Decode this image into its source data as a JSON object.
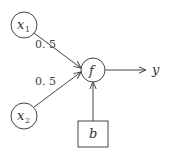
{
  "diagram": {
    "type": "perceptron",
    "colors": {
      "stroke": "#444444",
      "text": "#333333",
      "background": "#ffffff"
    },
    "nodes": [
      {
        "id": "x1",
        "label": "x",
        "subscript": "1",
        "shape": "circle"
      },
      {
        "id": "x2",
        "label": "x",
        "subscript": "2",
        "shape": "circle"
      },
      {
        "id": "f",
        "label": "f",
        "shape": "circle"
      },
      {
        "id": "b",
        "label": "b",
        "shape": "box"
      }
    ],
    "edges": [
      {
        "from": "x1",
        "to": "f",
        "weight": "0.5"
      },
      {
        "from": "x2",
        "to": "f",
        "weight": "0.5"
      },
      {
        "from": "b",
        "to": "f"
      },
      {
        "from": "f",
        "to": "y"
      }
    ],
    "output_label": "y",
    "labels": {
      "x1": "x",
      "x1_sub": "1",
      "x2": "x",
      "x2_sub": "2",
      "f": "f",
      "b": "b",
      "y": "y",
      "w1": "0. 5",
      "w2": "0. 5"
    }
  }
}
